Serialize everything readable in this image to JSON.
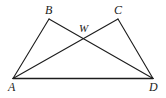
{
  "figure": {
    "type": "geometry-diagram",
    "background_color": "#ffffff",
    "stroke_color": "#1c1c1c",
    "stroke_width": 1.1,
    "width": 166,
    "height": 98,
    "labels": {
      "b": "B",
      "c": "C",
      "w": "W",
      "a": "A",
      "d": "D"
    },
    "points": {
      "A": {
        "x": 13,
        "y": 78.5
      },
      "B": {
        "x": 49,
        "y": 19
      },
      "C": {
        "x": 118,
        "y": 19
      },
      "D": {
        "x": 153,
        "y": 78.5
      },
      "W": {
        "x": 85.5,
        "y": 42
      }
    },
    "segments": [
      {
        "name": "AB",
        "from": "A",
        "to": "B"
      },
      {
        "name": "AC",
        "from": "A",
        "to": "C"
      },
      {
        "name": "BD",
        "from": "B",
        "to": "D"
      },
      {
        "name": "CD",
        "from": "C",
        "to": "D"
      },
      {
        "name": "AD",
        "from": "A",
        "to": "D"
      }
    ]
  }
}
